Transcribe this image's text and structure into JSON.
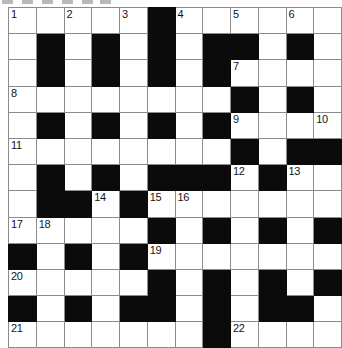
{
  "puzzle": {
    "kind": "crossword-grid",
    "columns": 12,
    "rows": 13,
    "colors": {
      "block_fill": "#0b0b0b",
      "cell_fill": "#ffffff",
      "grid_line": "#8c8c8c",
      "number_text": "#141414"
    },
    "legend": {
      "white_cell": "0",
      "black_cell": "1"
    },
    "layout": [
      [
        0,
        0,
        0,
        0,
        0,
        1,
        0,
        0,
        0,
        0,
        0,
        0
      ],
      [
        0,
        1,
        0,
        1,
        0,
        1,
        0,
        1,
        1,
        0,
        1,
        0
      ],
      [
        0,
        1,
        0,
        1,
        0,
        1,
        0,
        1,
        0,
        0,
        0,
        0
      ],
      [
        0,
        0,
        0,
        0,
        0,
        0,
        0,
        0,
        1,
        0,
        1,
        0
      ],
      [
        0,
        1,
        0,
        1,
        0,
        1,
        0,
        1,
        0,
        0,
        0,
        0
      ],
      [
        0,
        0,
        0,
        0,
        0,
        0,
        0,
        0,
        1,
        0,
        1,
        1
      ],
      [
        0,
        1,
        0,
        1,
        0,
        1,
        1,
        1,
        0,
        1,
        0,
        0
      ],
      [
        0,
        1,
        1,
        0,
        1,
        0,
        0,
        0,
        0,
        0,
        0,
        0
      ],
      [
        0,
        0,
        0,
        0,
        0,
        1,
        0,
        1,
        0,
        1,
        0,
        1
      ],
      [
        1,
        0,
        1,
        0,
        1,
        0,
        0,
        0,
        0,
        0,
        0,
        0
      ],
      [
        0,
        0,
        0,
        0,
        0,
        1,
        0,
        1,
        0,
        1,
        0,
        1
      ],
      [
        1,
        0,
        1,
        0,
        1,
        1,
        0,
        1,
        0,
        1,
        1,
        0
      ],
      [
        0,
        0,
        0,
        0,
        0,
        0,
        0,
        1,
        0,
        0,
        0,
        0
      ]
    ],
    "numbers": [
      {
        "row": 0,
        "col": 0,
        "label": "1"
      },
      {
        "row": 0,
        "col": 2,
        "label": "2"
      },
      {
        "row": 0,
        "col": 4,
        "label": "3"
      },
      {
        "row": 0,
        "col": 6,
        "label": "4"
      },
      {
        "row": 0,
        "col": 8,
        "label": "5"
      },
      {
        "row": 0,
        "col": 10,
        "label": "6"
      },
      {
        "row": 2,
        "col": 8,
        "label": "7"
      },
      {
        "row": 3,
        "col": 0,
        "label": "8"
      },
      {
        "row": 4,
        "col": 8,
        "label": "9"
      },
      {
        "row": 4,
        "col": 11,
        "label": "10"
      },
      {
        "row": 5,
        "col": 0,
        "label": "11"
      },
      {
        "row": 6,
        "col": 8,
        "label": "12"
      },
      {
        "row": 6,
        "col": 10,
        "label": "13"
      },
      {
        "row": 7,
        "col": 3,
        "label": "14"
      },
      {
        "row": 7,
        "col": 5,
        "label": "15"
      },
      {
        "row": 7,
        "col": 6,
        "label": "16"
      },
      {
        "row": 8,
        "col": 0,
        "label": "17"
      },
      {
        "row": 8,
        "col": 1,
        "label": "18"
      },
      {
        "row": 9,
        "col": 5,
        "label": "19"
      },
      {
        "row": 10,
        "col": 0,
        "label": "20"
      },
      {
        "row": 12,
        "col": 0,
        "label": "21"
      },
      {
        "row": 12,
        "col": 8,
        "label": "22"
      }
    ],
    "artifact_marks": [
      {
        "x": 2
      },
      {
        "x": 22
      },
      {
        "x": 42
      },
      {
        "x": 62
      },
      {
        "x": 82
      },
      {
        "x": 100
      }
    ]
  }
}
